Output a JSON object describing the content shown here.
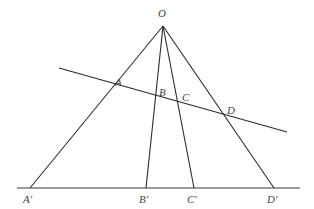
{
  "diagram": {
    "type": "projective-cross-ratio",
    "apex": {
      "label": "O",
      "x": 163,
      "y": 26,
      "label_x": 158,
      "label_y": 17
    },
    "transversal": {
      "x1": 59,
      "y1": 68,
      "x2": 287,
      "y2": 132
    },
    "baseline": {
      "x1": 17,
      "y1": 188,
      "x2": 300,
      "y2": 188
    },
    "rays": [
      {
        "name": "ray-a",
        "end_x": 30,
        "end_y": 188
      },
      {
        "name": "ray-b",
        "end_x": 146,
        "end_y": 188
      },
      {
        "name": "ray-c",
        "end_x": 194,
        "end_y": 188
      },
      {
        "name": "ray-d",
        "end_x": 274,
        "end_y": 188
      }
    ],
    "upper_points": [
      {
        "label": "A",
        "label_x": 115,
        "label_y": 86
      },
      {
        "label": "B",
        "label_x": 159,
        "label_y": 96
      },
      {
        "label": "C",
        "label_x": 182,
        "label_y": 101
      },
      {
        "label": "D",
        "label_x": 227,
        "label_y": 114
      }
    ],
    "lower_points": [
      {
        "label": "A'",
        "label_x": 23,
        "label_y": 203
      },
      {
        "label": "B'",
        "label_x": 139,
        "label_y": 203
      },
      {
        "label": "C'",
        "label_x": 187,
        "label_y": 203
      },
      {
        "label": "D'",
        "label_x": 267,
        "label_y": 203
      }
    ]
  }
}
